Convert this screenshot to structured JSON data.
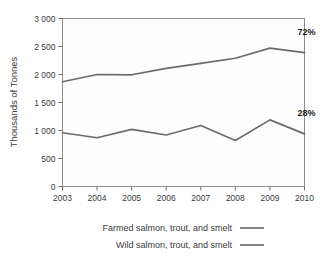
{
  "chart_data": {
    "type": "line",
    "title": "",
    "xlabel": "",
    "ylabel": "Thousands of Tonnes",
    "categories": [
      "2003",
      "2004",
      "2005",
      "2006",
      "2007",
      "2008",
      "2009",
      "2010"
    ],
    "x": [
      2003,
      2004,
      2005,
      2006,
      2007,
      2008,
      2009,
      2010
    ],
    "xlim": [
      2003,
      2010
    ],
    "ylim": [
      0,
      3000
    ],
    "yticks": [
      0,
      500,
      1000,
      1500,
      2000,
      2500,
      3000
    ],
    "ytick_labels": [
      "0",
      "500",
      "1 000",
      "1 500",
      "2 000",
      "2 500",
      "3 000"
    ],
    "grid": false,
    "legend_position": "bottom",
    "series": [
      {
        "name": "Farmed salmon, trout, and smelt",
        "color": "#6b6b6b",
        "values": [
          1870,
          2000,
          1995,
          2110,
          2200,
          2290,
          2470,
          2390
        ]
      },
      {
        "name": "Wild salmon, trout, and smelt",
        "color": "#6b6b6b",
        "values": [
          960,
          870,
          1020,
          920,
          1090,
          820,
          1190,
          940
        ]
      }
    ],
    "annotations": [
      {
        "text": "72%",
        "series": "Farmed salmon, trout, and smelt",
        "x": 2010,
        "value": 2700
      },
      {
        "text": "28%",
        "series": "Wild salmon, trout, and smelt",
        "x": 2010,
        "value": 1260
      }
    ]
  },
  "legend": {
    "items": [
      {
        "label": "Farmed salmon, trout, and smelt"
      },
      {
        "label": "Wild salmon, trout, and smelt"
      }
    ]
  }
}
